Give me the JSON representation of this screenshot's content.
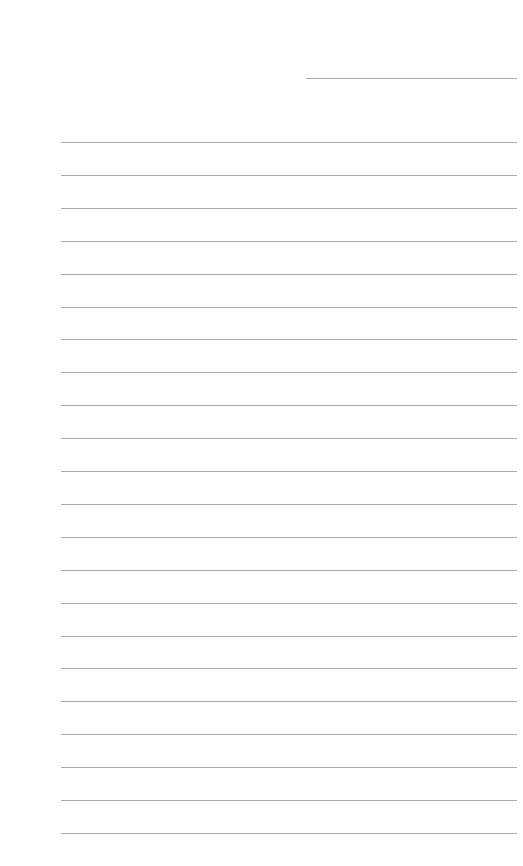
{
  "page": {
    "type": "lined-paper",
    "background": "#ffffff",
    "line_color": "#a9a9a9",
    "header_line": {
      "x": 306,
      "y": 78,
      "width": 211
    },
    "rules": {
      "x": 61,
      "width": 456,
      "start_y": 142,
      "spacing": 32.9,
      "count": 22
    }
  }
}
